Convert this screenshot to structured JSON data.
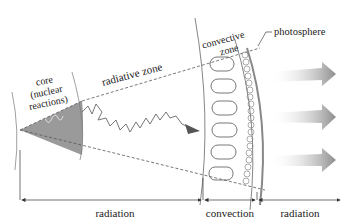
{
  "diagram": {
    "labels": {
      "core_line1": "core",
      "core_line2": "(nuclear",
      "core_line3": "reactions)",
      "radiative_zone": "radiative zone",
      "convective_line1": "convective",
      "convective_line2": "zone",
      "photosphere": "photosphere"
    },
    "bottom_scale": [
      {
        "label": "radiation",
        "region": "core + radiative zone"
      },
      {
        "label": "convection",
        "region": "convective zone"
      },
      {
        "label": "radiation",
        "region": "outside photosphere"
      }
    ],
    "colors": {
      "core_fill": "#9a9a9a",
      "line": "#555555",
      "arrow_gray": "#8a8a8a"
    },
    "outgoing_arrows": 3,
    "convection_cells": 6
  }
}
